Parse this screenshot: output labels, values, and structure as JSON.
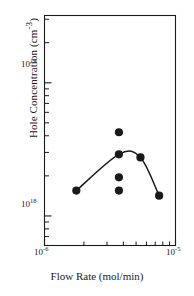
{
  "figure": {
    "name": "hole-concentration-vs-flow-rate-plot",
    "background_color": "#ffffff",
    "ink_color": "#1a1a1a"
  },
  "axes": {
    "x": {
      "title": "Flow Rate (mol/min)",
      "scale": "log",
      "min": 1e-06,
      "max": 1e-05,
      "tick_labels": [
        {
          "mantissa": "10",
          "exponent": "-6",
          "value": 1e-06
        },
        {
          "mantissa": "10",
          "exponent": "-5",
          "value": 1e-05
        }
      ],
      "minor_ticks": [
        2e-06,
        3e-06,
        4e-06,
        5e-06,
        6e-06,
        7e-06,
        8e-06,
        9e-06
      ]
    },
    "y": {
      "title": "Hole Concentration (cm",
      "title_exponent": "-3",
      "title_suffix": ")",
      "scale": "log",
      "min": 6e+17,
      "max": 3.2e+19,
      "tick_labels": [
        {
          "mantissa": "10",
          "exponent": "19",
          "value": 1e+19
        },
        {
          "mantissa": "10",
          "exponent": "18",
          "value": 1e+18
        }
      ],
      "minor_ticks": [
        7e+17,
        8e+17,
        9e+17,
        2e+18,
        3e+18,
        4e+18,
        5e+18,
        6e+18,
        7e+18,
        8e+18,
        9e+18,
        2e+19,
        3e+19
      ]
    }
  },
  "chart_data": {
    "type": "scatter",
    "title": "",
    "xlabel": "Flow Rate (mol/min)",
    "ylabel": "Hole Concentration (cm^-3)",
    "xscale": "log",
    "yscale": "log",
    "xlim": [
      1e-06,
      1e-05
    ],
    "ylim": [
      6e+17,
      3.2e+19
    ],
    "grid": false,
    "legend": "none",
    "series": [
      {
        "name": "Hole concentration (trend)",
        "marker": "filled-circle",
        "line": "solid",
        "x": [
          1.75e-06,
          3.7e-06,
          5.4e-06,
          7.5e-06
        ],
        "y": [
          1.55e+18,
          2.9e+18,
          2.75e+18,
          1.42e+18
        ]
      },
      {
        "name": "Hole concentration (scatter at 3.7e-6)",
        "marker": "filled-circle",
        "line": "none",
        "x": [
          3.7e-06,
          3.7e-06,
          3.7e-06
        ],
        "y": [
          4.25e+18,
          1.95e+18,
          1.55e+18
        ]
      }
    ],
    "points": [
      {
        "x": 1.75e-06,
        "y": 1.55e+18
      },
      {
        "x": 3.7e-06,
        "y": 4.25e+18
      },
      {
        "x": 3.7e-06,
        "y": 2.9e+18
      },
      {
        "x": 3.7e-06,
        "y": 1.95e+18
      },
      {
        "x": 3.7e-06,
        "y": 1.55e+18
      },
      {
        "x": 5.4e-06,
        "y": 2.75e+18
      },
      {
        "x": 7.5e-06,
        "y": 1.42e+18
      }
    ]
  }
}
